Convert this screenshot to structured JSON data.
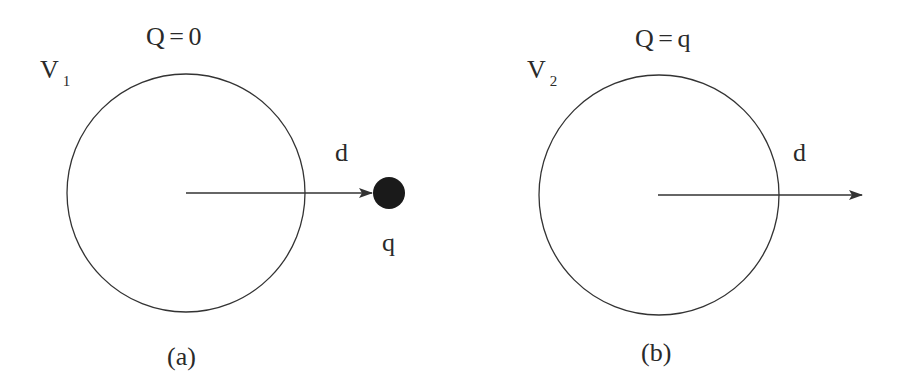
{
  "panels": [
    {
      "id": "a",
      "caption": "(a)",
      "potential_label": "V",
      "potential_subscript": "1",
      "charge_label": "Q = 0",
      "distance_label": "d",
      "point_charge_label": "q",
      "has_point_charge": true
    },
    {
      "id": "b",
      "caption": "(b)",
      "potential_label": "V",
      "potential_subscript": "2",
      "charge_label": "Q = q",
      "distance_label": "d",
      "has_point_charge": false
    }
  ],
  "colors": {
    "stroke": "#333333",
    "charge_fill": "#1a1a1a",
    "background": "#ffffff"
  }
}
